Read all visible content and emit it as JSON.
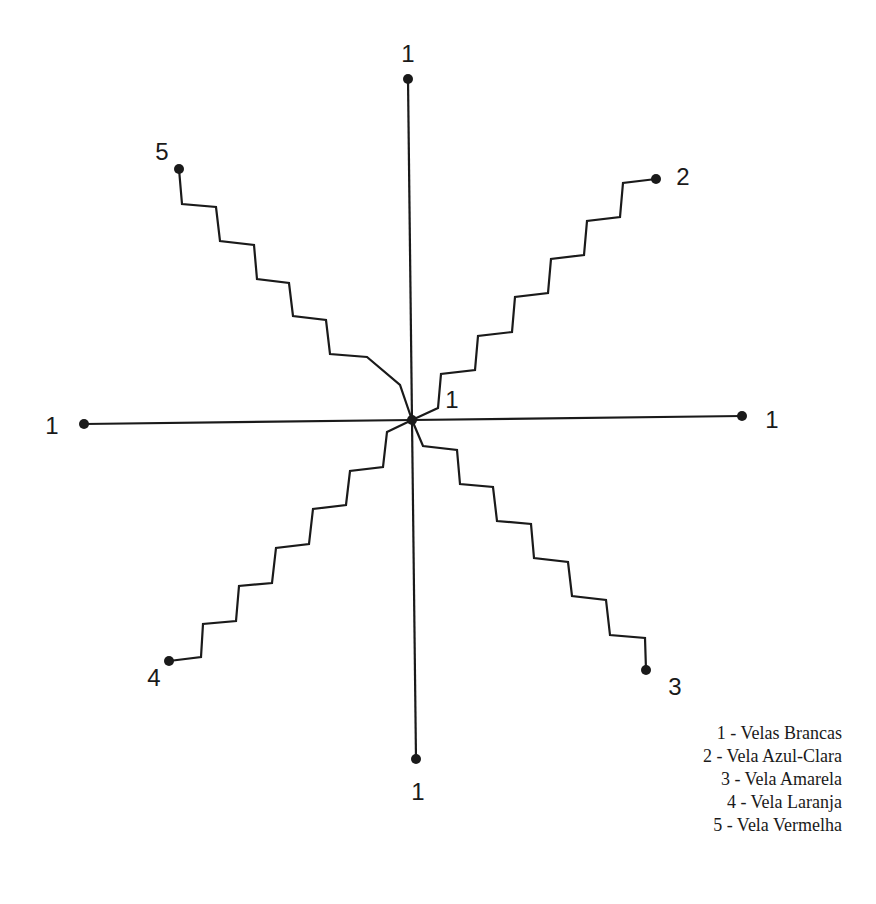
{
  "diagram": {
    "type": "candle-rose",
    "center": {
      "x": 412,
      "y": 420,
      "label": "1"
    },
    "stroke_color": "#1a1a1a",
    "straight_lines": [
      {
        "id": "north",
        "label": "1",
        "end": [
          408,
          79
        ],
        "label_pos": [
          408,
          62
        ]
      },
      {
        "id": "west",
        "label": "1",
        "end": [
          84,
          424
        ],
        "label_pos": [
          52,
          434
        ]
      },
      {
        "id": "east",
        "label": "1",
        "end": [
          742,
          416
        ],
        "label_pos": [
          772,
          428
        ]
      },
      {
        "id": "south",
        "label": "1",
        "end": [
          416,
          759
        ],
        "label_pos": [
          418,
          800
        ]
      }
    ],
    "staircases": [
      {
        "id": "line-2",
        "label": "2",
        "label_pos": [
          683,
          185
        ],
        "points": [
          [
            412,
            420
          ],
          [
            438,
            408
          ],
          [
            441,
            374
          ],
          [
            475,
            370
          ],
          [
            478,
            336
          ],
          [
            512,
            332
          ],
          [
            515,
            297
          ],
          [
            548,
            293
          ],
          [
            551,
            259
          ],
          [
            584,
            255
          ],
          [
            587,
            221
          ],
          [
            620,
            217
          ],
          [
            623,
            183
          ],
          [
            656,
            179
          ]
        ]
      },
      {
        "id": "line-3",
        "label": "3",
        "label_pos": [
          675,
          695
        ],
        "points": [
          [
            412,
            420
          ],
          [
            423,
            446
          ],
          [
            457,
            450
          ],
          [
            460,
            484
          ],
          [
            493,
            487
          ],
          [
            497,
            521
          ],
          [
            531,
            524
          ],
          [
            534,
            558
          ],
          [
            568,
            562
          ],
          [
            572,
            596
          ],
          [
            606,
            600
          ],
          [
            610,
            635
          ],
          [
            645,
            638
          ],
          [
            646,
            670
          ]
        ]
      },
      {
        "id": "line-4",
        "label": "4",
        "label_pos": [
          154,
          686
        ],
        "points": [
          [
            412,
            420
          ],
          [
            387,
            432
          ],
          [
            383,
            467
          ],
          [
            350,
            471
          ],
          [
            346,
            505
          ],
          [
            313,
            509
          ],
          [
            309,
            544
          ],
          [
            276,
            548
          ],
          [
            272,
            583
          ],
          [
            239,
            586
          ],
          [
            236,
            621
          ],
          [
            203,
            624
          ],
          [
            201,
            657
          ],
          [
            169,
            661
          ]
        ]
      },
      {
        "id": "line-5",
        "label": "5",
        "label_pos": [
          162,
          160
        ],
        "points": [
          [
            412,
            420
          ],
          [
            400,
            385
          ],
          [
            367,
            357
          ],
          [
            330,
            354
          ],
          [
            326,
            320
          ],
          [
            293,
            316
          ],
          [
            289,
            283
          ],
          [
            257,
            279
          ],
          [
            254,
            245
          ],
          [
            220,
            241
          ],
          [
            216,
            207
          ],
          [
            182,
            204
          ],
          [
            179,
            169
          ]
        ]
      }
    ],
    "center_label_pos": [
      452,
      408
    ]
  },
  "legend": {
    "items": [
      {
        "label": "1 - Velas Brancas"
      },
      {
        "label": "2 - Vela Azul-Clara"
      },
      {
        "label": "3 - Vela Amarela"
      },
      {
        "label": "4 - Vela Laranja"
      },
      {
        "label": "5 - Vela Vermelha"
      }
    ]
  }
}
